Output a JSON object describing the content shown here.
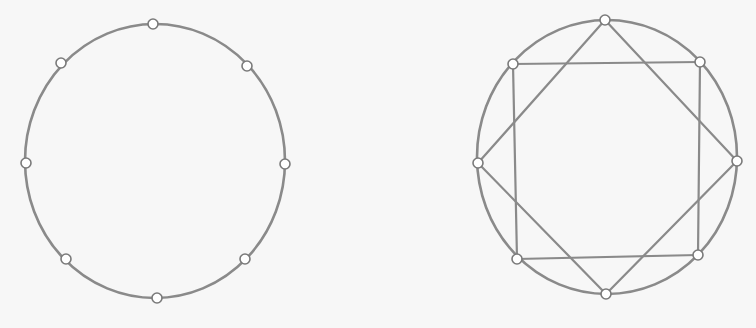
{
  "style": {
    "background": "#f7f7f7",
    "stroke_color": "#8a8a8a",
    "node_stroke_color": "#7a7a7a",
    "node_fill": "#ffffff",
    "circle_stroke_width": 2.6,
    "edge_stroke_width": 2.2,
    "node_radius": 5
  },
  "figures": [
    {
      "id": "left",
      "description": "Circle with 8 equally spaced nodes",
      "circle": {
        "cx": 155,
        "cy": 161,
        "rx": 130,
        "ry": 137
      },
      "nodes": [
        {
          "name": "top",
          "x": 153,
          "y": 24
        },
        {
          "name": "top-right",
          "x": 247,
          "y": 66
        },
        {
          "name": "right",
          "x": 285,
          "y": 164
        },
        {
          "name": "bottom-right",
          "x": 245,
          "y": 259
        },
        {
          "name": "bottom",
          "x": 157,
          "y": 298
        },
        {
          "name": "bottom-left",
          "x": 66,
          "y": 259
        },
        {
          "name": "left",
          "x": 26,
          "y": 163
        },
        {
          "name": "top-left",
          "x": 61,
          "y": 63
        }
      ],
      "edges": []
    },
    {
      "id": "right",
      "description": "Circle with 8 nodes joined as two overlapping squares (octagram)",
      "circle": {
        "cx": 607,
        "cy": 157,
        "rx": 130,
        "ry": 137
      },
      "nodes": [
        {
          "name": "top",
          "x": 605,
          "y": 20
        },
        {
          "name": "top-right",
          "x": 700,
          "y": 62
        },
        {
          "name": "right",
          "x": 737,
          "y": 161
        },
        {
          "name": "bottom-right",
          "x": 698,
          "y": 255
        },
        {
          "name": "bottom",
          "x": 606,
          "y": 294
        },
        {
          "name": "bottom-left",
          "x": 517,
          "y": 259
        },
        {
          "name": "left",
          "x": 478,
          "y": 163
        },
        {
          "name": "top-left",
          "x": 513,
          "y": 64
        }
      ],
      "edges": [
        [
          7,
          1
        ],
        [
          1,
          3
        ],
        [
          3,
          5
        ],
        [
          5,
          7
        ],
        [
          0,
          2
        ],
        [
          2,
          4
        ],
        [
          4,
          6
        ],
        [
          6,
          0
        ]
      ]
    }
  ]
}
